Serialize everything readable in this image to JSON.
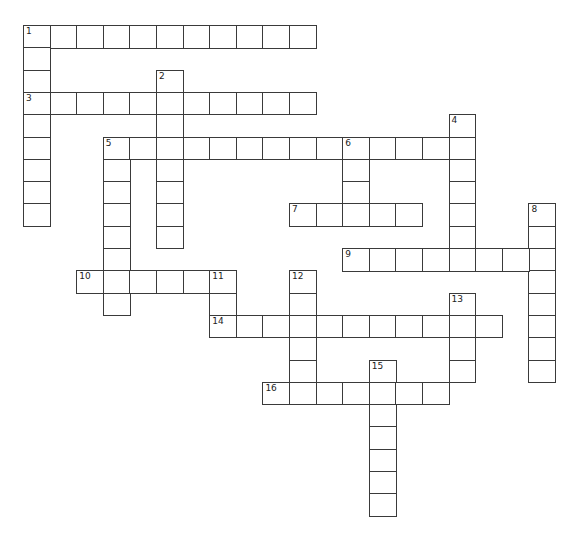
{
  "puzzle": {
    "type": "crossword",
    "grid": {
      "origin_x": 23,
      "origin_y": 25,
      "cell_width": 26.6,
      "cell_height": 22.3,
      "line_color": "#3a3a3a",
      "cell_fill": "#ffffff"
    },
    "entries": [
      {
        "number": "1",
        "direction": "across",
        "row": 0,
        "col": 0,
        "length": 11
      },
      {
        "number": "1",
        "direction": "down",
        "row": 0,
        "col": 0,
        "length": 9
      },
      {
        "number": "2",
        "direction": "down",
        "row": 2,
        "col": 5,
        "length": 8
      },
      {
        "number": "3",
        "direction": "across",
        "row": 3,
        "col": 0,
        "length": 11
      },
      {
        "number": "4",
        "direction": "down",
        "row": 4,
        "col": 16,
        "length": 7
      },
      {
        "number": "5",
        "direction": "across",
        "row": 5,
        "col": 3,
        "length": 14
      },
      {
        "number": "5",
        "direction": "down",
        "row": 5,
        "col": 3,
        "length": 8
      },
      {
        "number": "6",
        "direction": "down",
        "row": 5,
        "col": 12,
        "length": 3
      },
      {
        "number": "7",
        "direction": "across",
        "row": 8,
        "col": 10,
        "length": 5
      },
      {
        "number": "8",
        "direction": "down",
        "row": 8,
        "col": 19,
        "length": 8
      },
      {
        "number": "9",
        "direction": "across",
        "row": 10,
        "col": 12,
        "length": 8
      },
      {
        "number": "10",
        "direction": "across",
        "row": 11,
        "col": 2,
        "length": 6
      },
      {
        "number": "11",
        "direction": "down",
        "row": 11,
        "col": 7,
        "length": 3
      },
      {
        "number": "12",
        "direction": "down",
        "row": 11,
        "col": 10,
        "length": 6
      },
      {
        "number": "13",
        "direction": "down",
        "row": 12,
        "col": 16,
        "length": 4
      },
      {
        "number": "14",
        "direction": "across",
        "row": 13,
        "col": 7,
        "length": 11
      },
      {
        "number": "15",
        "direction": "down",
        "row": 15,
        "col": 13,
        "length": 7
      },
      {
        "number": "16",
        "direction": "across",
        "row": 16,
        "col": 9,
        "length": 7
      }
    ]
  }
}
